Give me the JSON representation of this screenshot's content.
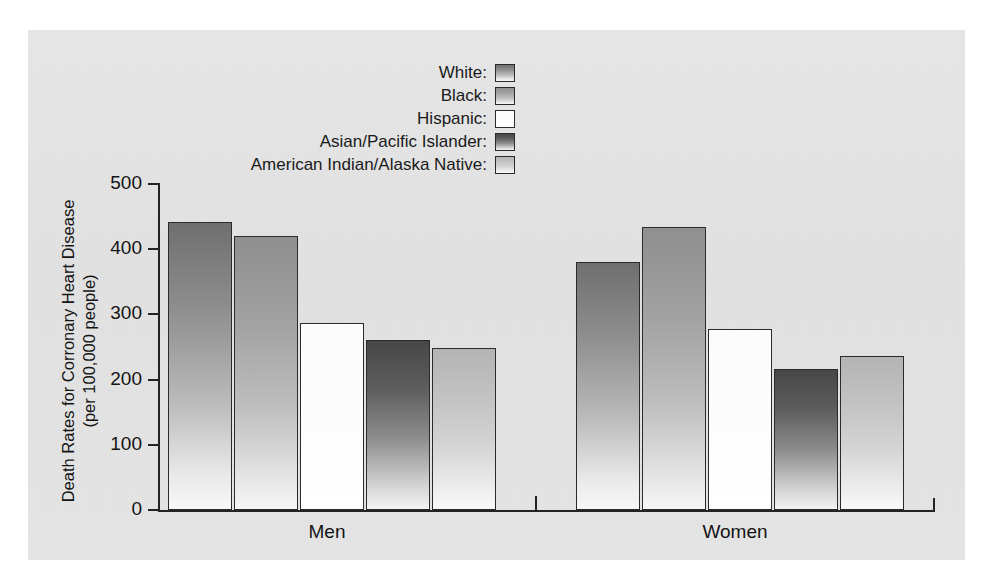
{
  "chart_data": {
    "type": "bar",
    "title": "",
    "xlabel": "",
    "ylabel": "Death Rates for Corronary Heart Disease (per 100,000 people)",
    "ylabel_line1": "Death Rates for Corronary Heart Disease",
    "ylabel_line2": "(per 100,000 people)",
    "ylim": [
      0,
      500
    ],
    "yticks": [
      0,
      100,
      200,
      300,
      400,
      500
    ],
    "ytick_labels": [
      "0",
      "100",
      "200",
      "300",
      "400",
      "500"
    ],
    "grid": false,
    "legend_position": "top-center",
    "categories": [
      "Men",
      "Women"
    ],
    "series": [
      {
        "name": "White",
        "legend_label": "White:",
        "color": "#8e8e8e",
        "values": [
          441,
          380
        ]
      },
      {
        "name": "Black",
        "legend_label": "Black:",
        "color": "#a8a8a8",
        "values": [
          421,
          434
        ]
      },
      {
        "name": "Hispanic",
        "legend_label": "Hispanic:",
        "color": "#fdfdfd",
        "values": [
          287,
          277
        ]
      },
      {
        "name": "Asian/Pacific Islander",
        "legend_label": "Asian/Pacific Islander:",
        "color": "#5d5d5d",
        "values": [
          260,
          216
        ]
      },
      {
        "name": "American Indian/Alaska Native",
        "legend_label": "American Indian/Alaska Native:",
        "color": "#c2c2c2",
        "values": [
          248,
          236
        ]
      }
    ]
  },
  "axis": {
    "group_men": "Men",
    "group_women": "Women"
  },
  "legend": {
    "items": [
      {
        "label": "White:"
      },
      {
        "label": "Black:"
      },
      {
        "label": "Hispanic:"
      },
      {
        "label": "Asian/Pacific Islander:"
      },
      {
        "label": "American Indian/Alaska Native:"
      }
    ]
  }
}
